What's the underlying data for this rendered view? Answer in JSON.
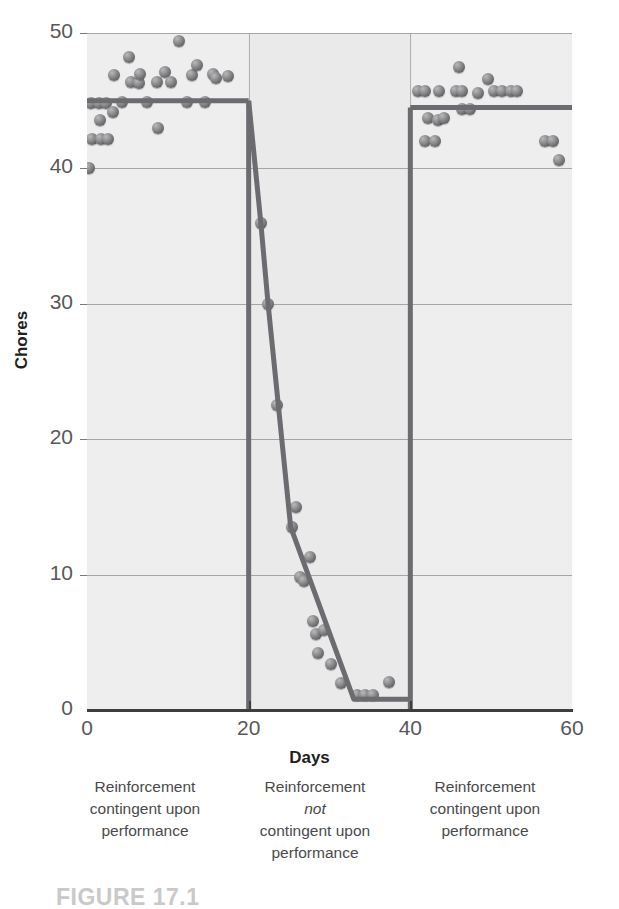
{
  "figure": {
    "number_label": "FIGURE 17.1"
  },
  "chart_data": {
    "type": "scatter",
    "title": "",
    "xlabel": "Days",
    "ylabel": "Chores",
    "xlim": [
      0,
      60
    ],
    "ylim": [
      0,
      50
    ],
    "xticks": [
      0,
      20,
      40,
      60
    ],
    "yticks": [
      0,
      10,
      20,
      30,
      40,
      50
    ],
    "grid": "horizontal",
    "legend": "none",
    "phase_boundaries": [
      20,
      40
    ],
    "phases": [
      {
        "name": "baseline-reinforcement",
        "x_range": [
          0,
          20
        ],
        "caption_lines": [
          "Reinforcement",
          "contingent upon",
          "performance"
        ],
        "trend_level": 45
      },
      {
        "name": "withdrawal",
        "x_range": [
          20,
          40
        ],
        "caption_lines": [
          "Reinforcement",
          "not",
          "contingent upon",
          "performance"
        ],
        "caption_italic_line": "not",
        "trend_level": null
      },
      {
        "name": "reinstatement",
        "x_range": [
          40,
          60
        ],
        "caption_lines": [
          "Reinforcement",
          "contingent upon",
          "performance"
        ],
        "trend_level": 44.5
      }
    ],
    "points": [
      [
        0.3,
        40.0
      ],
      [
        0.5,
        44.8
      ],
      [
        0.6,
        42.2
      ],
      [
        1.5,
        44.8
      ],
      [
        1.6,
        43.6
      ],
      [
        1.7,
        42.2
      ],
      [
        2.4,
        44.8
      ],
      [
        2.6,
        42.2
      ],
      [
        3.2,
        44.2
      ],
      [
        3.4,
        46.9
      ],
      [
        4.3,
        44.9
      ],
      [
        5.2,
        48.2
      ],
      [
        5.4,
        46.4
      ],
      [
        6.4,
        46.3
      ],
      [
        6.6,
        47.0
      ],
      [
        7.4,
        44.9
      ],
      [
        8.6,
        46.4
      ],
      [
        8.8,
        43.0
      ],
      [
        9.6,
        47.1
      ],
      [
        10.4,
        46.4
      ],
      [
        11.4,
        49.4
      ],
      [
        12.4,
        44.9
      ],
      [
        13.0,
        46.9
      ],
      [
        13.6,
        47.6
      ],
      [
        14.6,
        44.9
      ],
      [
        15.6,
        47.0
      ],
      [
        16.0,
        46.7
      ],
      [
        17.4,
        46.8
      ],
      [
        21.5,
        36.0
      ],
      [
        22.4,
        30.0
      ],
      [
        23.5,
        22.5
      ],
      [
        25.4,
        13.5
      ],
      [
        25.8,
        15.0
      ],
      [
        26.4,
        9.8
      ],
      [
        26.9,
        9.5
      ],
      [
        27.6,
        11.3
      ],
      [
        28.0,
        6.6
      ],
      [
        28.3,
        5.6
      ],
      [
        29.3,
        5.9
      ],
      [
        28.6,
        4.2
      ],
      [
        30.2,
        3.4
      ],
      [
        31.4,
        2.0
      ],
      [
        33.4,
        1.1
      ],
      [
        34.4,
        1.1
      ],
      [
        35.4,
        1.1
      ],
      [
        37.4,
        2.1
      ],
      [
        41.0,
        45.7
      ],
      [
        41.8,
        45.7
      ],
      [
        42.2,
        43.7
      ],
      [
        43.4,
        43.6
      ],
      [
        43.6,
        45.7
      ],
      [
        44.2,
        43.7
      ],
      [
        41.8,
        42.0
      ],
      [
        43.0,
        42.0
      ],
      [
        45.6,
        45.7
      ],
      [
        46.4,
        45.7
      ],
      [
        46.0,
        47.5
      ],
      [
        46.4,
        44.4
      ],
      [
        47.4,
        44.4
      ],
      [
        48.4,
        45.6
      ],
      [
        49.6,
        46.6
      ],
      [
        50.4,
        45.7
      ],
      [
        51.4,
        45.7
      ],
      [
        52.4,
        45.7
      ],
      [
        53.2,
        45.7
      ],
      [
        56.6,
        42.0
      ],
      [
        57.6,
        42.0
      ],
      [
        58.4,
        40.6
      ]
    ],
    "trend_segments": [
      [
        [
          0,
          45
        ],
        [
          20,
          45
        ]
      ],
      [
        [
          20,
          45
        ],
        [
          21.5,
          36
        ],
        [
          22.4,
          30
        ],
        [
          25.2,
          13.5
        ],
        [
          33.0,
          0.8
        ],
        [
          39.8,
          0.8
        ]
      ],
      [
        [
          40,
          44.5
        ],
        [
          60,
          44.5
        ]
      ]
    ],
    "trend_verticals": [
      {
        "x": 20,
        "y_from": 45,
        "y_to": 0
      },
      {
        "x": 40,
        "y_from": 0,
        "y_to": 44.5
      }
    ]
  },
  "axis": {
    "x_tick_labels": [
      "0",
      "20",
      "40",
      "60"
    ],
    "y_tick_labels": [
      "0",
      "10",
      "20",
      "30",
      "40",
      "50"
    ],
    "x_title": "Days",
    "y_title": "Chores"
  },
  "colors": {
    "plot_background": "#ededed",
    "gridline": "#8d8d8d",
    "axis": "#3e3e3e",
    "trend_line": "#6b6b70",
    "dot": "#76767a",
    "tick_text": "#58585a",
    "caption_text": "#4a4a4c",
    "figure_number": "#c9c9c9"
  }
}
